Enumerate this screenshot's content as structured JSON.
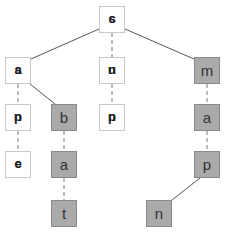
{
  "diagram": {
    "type": "trie",
    "nodes": [
      {
        "id": "root",
        "label": "",
        "overlap_glyphs": [
          "c",
          "s"
        ],
        "filled": false
      },
      {
        "id": "L1a",
        "label": "",
        "overlap_glyphs": [
          "a",
          "s"
        ],
        "filled": false
      },
      {
        "id": "L1b",
        "label": "",
        "overlap_glyphs": [
          "u",
          "n"
        ],
        "filled": false
      },
      {
        "id": "m",
        "label": "m",
        "filled": true
      },
      {
        "id": "L2a",
        "label": "",
        "overlap_glyphs": [
          "p",
          "n"
        ],
        "filled": false
      },
      {
        "id": "b",
        "label": "b",
        "filled": true
      },
      {
        "id": "L2c",
        "label": "",
        "overlap_glyphs": [
          "p",
          "n"
        ],
        "filled": false
      },
      {
        "id": "a2",
        "label": "a",
        "filled": true
      },
      {
        "id": "L3a",
        "label": "",
        "overlap_glyphs": [
          "e",
          "c"
        ],
        "filled": false
      },
      {
        "id": "a1",
        "label": "a",
        "filled": true
      },
      {
        "id": "p",
        "label": "p",
        "filled": true
      },
      {
        "id": "t",
        "label": "t",
        "filled": true
      },
      {
        "id": "n",
        "label": "n",
        "filled": true
      }
    ],
    "edges": [
      {
        "from": "root",
        "to": "L1a",
        "style": "solid"
      },
      {
        "from": "root",
        "to": "L1b",
        "style": "dashed"
      },
      {
        "from": "root",
        "to": "m",
        "style": "solid"
      },
      {
        "from": "L1a",
        "to": "L2a",
        "style": "dashed"
      },
      {
        "from": "L1a",
        "to": "b",
        "style": "solid"
      },
      {
        "from": "L1b",
        "to": "L2c",
        "style": "dashed"
      },
      {
        "from": "m",
        "to": "a2",
        "style": "dashed"
      },
      {
        "from": "L2a",
        "to": "L3a",
        "style": "dashed"
      },
      {
        "from": "b",
        "to": "a1",
        "style": "dashed"
      },
      {
        "from": "a2",
        "to": "p",
        "style": "dashed"
      },
      {
        "from": "a1",
        "to": "t",
        "style": "dashed"
      },
      {
        "from": "p",
        "to": "n",
        "style": "solid"
      }
    ]
  }
}
